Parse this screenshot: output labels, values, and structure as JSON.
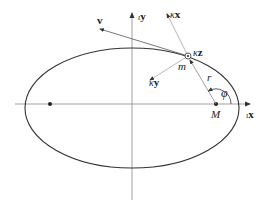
{
  "figure": {
    "type": "orbital-diagram",
    "colors": {
      "stroke": "#333333",
      "axis": "#888888",
      "vector": "#555555",
      "background": "#ffffff"
    }
  },
  "labels": {
    "inertial_x": {
      "prefix": "ι",
      "symbol": "x"
    },
    "inertial_y": {
      "prefix": "ι",
      "symbol": "y"
    },
    "body_x": {
      "prefix": "κ",
      "symbol": "x"
    },
    "body_y": {
      "prefix": "κ",
      "symbol": "y"
    },
    "body_z": {
      "prefix": "κ",
      "symbol": "z"
    },
    "velocity": "v",
    "mass": "m",
    "central_body": "M",
    "radius": "r",
    "angle": "φ"
  }
}
